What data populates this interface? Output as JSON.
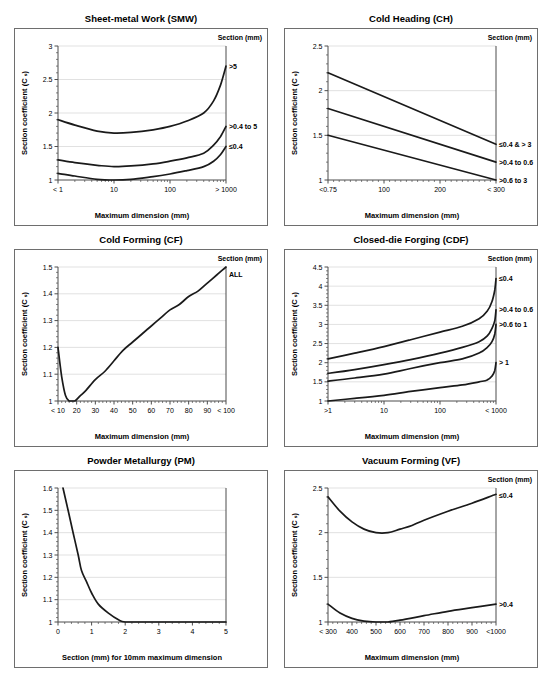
{
  "styles": {
    "curve_color": "#1a1a1a",
    "axis_color": "#4d4d4d",
    "grid_color": "#d9d9d9",
    "panel_border_color": "#6e6e6e",
    "text_color": "#000000"
  },
  "chart_data": [
    {
      "key": "smw",
      "type": "line",
      "title": "Sheet-metal Work (SMW)",
      "legend_title": "Section (mm)",
      "xlabel": "Maximum dimension (mm)",
      "ylabel": "Section coefficient (C ₛ)",
      "x_scale": "log",
      "x_min": 1,
      "x_max": 1000,
      "x_ticks": [
        {
          "value": 1,
          "label": "< 1"
        },
        {
          "value": 10,
          "label": "10"
        },
        {
          "value": 100,
          "label": "100"
        },
        {
          "value": 1000,
          "label": "> 1000"
        }
      ],
      "y_min": 1,
      "y_max": 3,
      "y_ticks": [
        1,
        1.5,
        2,
        2.5,
        3
      ],
      "y_minor_step": 0.1,
      "grid": true,
      "legend_position": "curve-ends-right",
      "series": [
        {
          "name": ">5",
          "points": [
            [
              1,
              1.9
            ],
            [
              2,
              1.82
            ],
            [
              5,
              1.73
            ],
            [
              10,
              1.7
            ],
            [
              20,
              1.71
            ],
            [
              50,
              1.75
            ],
            [
              100,
              1.8
            ],
            [
              200,
              1.88
            ],
            [
              400,
              2.0
            ],
            [
              600,
              2.18
            ],
            [
              800,
              2.42
            ],
            [
              1000,
              2.7
            ]
          ]
        },
        {
          "name": ">0.4 to 5",
          "points": [
            [
              1,
              1.3
            ],
            [
              2,
              1.26
            ],
            [
              5,
              1.22
            ],
            [
              10,
              1.2
            ],
            [
              20,
              1.21
            ],
            [
              50,
              1.24
            ],
            [
              100,
              1.28
            ],
            [
              200,
              1.33
            ],
            [
              400,
              1.4
            ],
            [
              600,
              1.52
            ],
            [
              800,
              1.65
            ],
            [
              1000,
              1.8
            ]
          ]
        },
        {
          "name": "≤0.4",
          "points": [
            [
              1,
              1.1
            ],
            [
              2,
              1.06
            ],
            [
              5,
              1.01
            ],
            [
              10,
              1.0
            ],
            [
              20,
              1.01
            ],
            [
              50,
              1.05
            ],
            [
              100,
              1.09
            ],
            [
              200,
              1.14
            ],
            [
              400,
              1.2
            ],
            [
              600,
              1.28
            ],
            [
              800,
              1.38
            ],
            [
              1000,
              1.5
            ]
          ]
        }
      ]
    },
    {
      "key": "ch",
      "type": "line",
      "title": "Cold Heading (CH)",
      "legend_title": "Section (mm)",
      "xlabel": "Maximum dimension (mm)",
      "ylabel": "Section coefficient (C ₛ)",
      "x_scale": "linear",
      "x_min": 0,
      "x_max": 300,
      "x_minor_step": 10,
      "x_ticks": [
        {
          "value": 0,
          "label": "<0.75"
        },
        {
          "value": 100,
          "label": "100"
        },
        {
          "value": 200,
          "label": "200"
        },
        {
          "value": 300,
          "label": "< 300"
        }
      ],
      "y_min": 1,
      "y_max": 2.5,
      "y_ticks": [
        1,
        1.5,
        2,
        2.5
      ],
      "y_minor_step": 0.1,
      "grid": true,
      "legend_position": "curve-ends-right",
      "series": [
        {
          "name": "≤0.4 & > 3",
          "points": [
            [
              0,
              2.2
            ],
            [
              300,
              1.4
            ]
          ]
        },
        {
          "name": ">0.4 to 0.6",
          "points": [
            [
              0,
              1.8
            ],
            [
              300,
              1.2
            ]
          ]
        },
        {
          "name": ">0.6 to 3",
          "points": [
            [
              0,
              1.5
            ],
            [
              300,
              1.0
            ]
          ]
        }
      ]
    },
    {
      "key": "cf",
      "type": "line",
      "title": "Cold Forming (CF)",
      "legend_title": "Section (mm)",
      "xlabel": "Maximum dimension (mm)",
      "ylabel": "Section coefficient (C ₛ)",
      "x_scale": "linear",
      "x_min": 10,
      "x_max": 100,
      "x_minor_step": 2,
      "x_ticks": [
        {
          "value": 10,
          "label": "< 10"
        },
        {
          "value": 20,
          "label": "20"
        },
        {
          "value": 30,
          "label": "30"
        },
        {
          "value": 40,
          "label": "40"
        },
        {
          "value": 50,
          "label": "50"
        },
        {
          "value": 60,
          "label": "60"
        },
        {
          "value": 70,
          "label": "70"
        },
        {
          "value": 80,
          "label": "80"
        },
        {
          "value": 90,
          "label": "90"
        },
        {
          "value": 100,
          "label": "< 100"
        }
      ],
      "y_min": 1,
      "y_max": 1.5,
      "y_ticks": [
        1,
        1.1,
        1.2,
        1.3,
        1.4,
        1.5
      ],
      "y_minor_step": 0.02,
      "grid": true,
      "legend_position": "curve-ends-right",
      "series": [
        {
          "name": "ALL",
          "points": [
            [
              10,
              1.2
            ],
            [
              12,
              1.09
            ],
            [
              14,
              1.02
            ],
            [
              16,
              1.0
            ],
            [
              19,
              1.0
            ],
            [
              22,
              1.02
            ],
            [
              25,
              1.04
            ],
            [
              30,
              1.08
            ],
            [
              35,
              1.11
            ],
            [
              40,
              1.15
            ],
            [
              45,
              1.19
            ],
            [
              50,
              1.22
            ],
            [
              55,
              1.25
            ],
            [
              60,
              1.28
            ],
            [
              65,
              1.31
            ],
            [
              70,
              1.34
            ],
            [
              75,
              1.36
            ],
            [
              80,
              1.39
            ],
            [
              85,
              1.41
            ],
            [
              90,
              1.44
            ],
            [
              95,
              1.47
            ],
            [
              100,
              1.5
            ]
          ]
        }
      ]
    },
    {
      "key": "cdf",
      "type": "line",
      "title": "Closed-die Forging (CDF)",
      "legend_title": "Section (mm)",
      "xlabel": "Maximum dimension (mm)",
      "ylabel": "Section coefficient (C ₛ)",
      "x_scale": "log",
      "x_min": 1,
      "x_max": 1000,
      "x_ticks": [
        {
          "value": 1,
          "label": ">1"
        },
        {
          "value": 10,
          "label": "10"
        },
        {
          "value": 100,
          "label": "100"
        },
        {
          "value": 1000,
          "label": "< 1000"
        }
      ],
      "y_min": 1,
      "y_max": 4.5,
      "y_ticks": [
        1,
        1.5,
        2,
        2.5,
        3,
        3.5,
        4,
        4.5
      ],
      "y_minor_step": 0.1,
      "grid": true,
      "legend_position": "curve-ends-right",
      "series": [
        {
          "name": "≤0.4",
          "points": [
            [
              1,
              2.1
            ],
            [
              3,
              2.25
            ],
            [
              10,
              2.42
            ],
            [
              30,
              2.6
            ],
            [
              100,
              2.8
            ],
            [
              250,
              2.95
            ],
            [
              500,
              3.15
            ],
            [
              700,
              3.35
            ],
            [
              850,
              3.6
            ],
            [
              950,
              3.9
            ],
            [
              1000,
              4.2
            ]
          ]
        },
        {
          "name": ">0.4 to 0.6",
          "points": [
            [
              1,
              1.72
            ],
            [
              3,
              1.82
            ],
            [
              10,
              1.95
            ],
            [
              30,
              2.08
            ],
            [
              100,
              2.25
            ],
            [
              250,
              2.4
            ],
            [
              500,
              2.55
            ],
            [
              700,
              2.7
            ],
            [
              850,
              2.9
            ],
            [
              950,
              3.1
            ],
            [
              1000,
              3.38
            ]
          ]
        },
        {
          "name": ">0.6 to 1",
          "points": [
            [
              1,
              1.52
            ],
            [
              3,
              1.6
            ],
            [
              10,
              1.7
            ],
            [
              30,
              1.85
            ],
            [
              100,
              2.0
            ],
            [
              250,
              2.1
            ],
            [
              500,
              2.25
            ],
            [
              700,
              2.4
            ],
            [
              850,
              2.55
            ],
            [
              950,
              2.75
            ],
            [
              1000,
              3.0
            ]
          ]
        },
        {
          "name": "> 1",
          "points": [
            [
              1,
              1.0
            ],
            [
              3,
              1.07
            ],
            [
              10,
              1.15
            ],
            [
              30,
              1.25
            ],
            [
              100,
              1.35
            ],
            [
              250,
              1.42
            ],
            [
              500,
              1.5
            ],
            [
              700,
              1.55
            ],
            [
              850,
              1.65
            ],
            [
              950,
              1.8
            ],
            [
              1000,
              2.0
            ]
          ]
        }
      ]
    },
    {
      "key": "pm",
      "type": "line",
      "title": "Powder Metallurgy (PM)",
      "legend_title": null,
      "xlabel": "Section (mm) for 10mm maximum dimension",
      "ylabel": "Section coefficient (C ₛ)",
      "x_scale": "linear",
      "x_min": 0,
      "x_max": 5,
      "x_minor_step": 0.2,
      "x_ticks": [
        {
          "value": 0,
          "label": "0"
        },
        {
          "value": 1,
          "label": "1"
        },
        {
          "value": 2,
          "label": "2"
        },
        {
          "value": 3,
          "label": "3"
        },
        {
          "value": 4,
          "label": "4"
        },
        {
          "value": 5,
          "label": "5"
        }
      ],
      "y_min": 1,
      "y_max": 1.6,
      "y_ticks": [
        1,
        1.1,
        1.2,
        1.3,
        1.4,
        1.5,
        1.6
      ],
      "y_minor_step": 0.02,
      "grid": true,
      "legend_position": "none",
      "series": [
        {
          "name": null,
          "points": [
            [
              0.15,
              1.6
            ],
            [
              0.3,
              1.5
            ],
            [
              0.45,
              1.4
            ],
            [
              0.6,
              1.3
            ],
            [
              0.7,
              1.23
            ],
            [
              0.85,
              1.18
            ],
            [
              1.0,
              1.13
            ],
            [
              1.2,
              1.08
            ],
            [
              1.5,
              1.04
            ],
            [
              1.8,
              1.01
            ],
            [
              2.0,
              1.0
            ],
            [
              2.5,
              1.0
            ],
            [
              3,
              1.0
            ],
            [
              4,
              1.0
            ],
            [
              5,
              1.0
            ]
          ]
        }
      ]
    },
    {
      "key": "vf",
      "type": "line",
      "title": "Vacuum Forming (VF)",
      "legend_title": "Section (mm)",
      "xlabel": "Maximum dimension (mm)",
      "ylabel": "Section coefficient (C ₛ)",
      "x_scale": "linear",
      "x_min": 300,
      "x_max": 1000,
      "x_minor_step": 20,
      "x_ticks": [
        {
          "value": 300,
          "label": "< 300"
        },
        {
          "value": 400,
          "label": "400"
        },
        {
          "value": 500,
          "label": "500"
        },
        {
          "value": 600,
          "label": "600"
        },
        {
          "value": 700,
          "label": "700"
        },
        {
          "value": 800,
          "label": "800"
        },
        {
          "value": 900,
          "label": "900"
        },
        {
          "value": 1000,
          "label": "<1000"
        }
      ],
      "y_min": 1,
      "y_max": 2.5,
      "y_ticks": [
        1,
        1.5,
        2,
        2.5
      ],
      "y_minor_step": 0.1,
      "grid": true,
      "legend_position": "curve-ends-right",
      "series": [
        {
          "name": "≤0.4",
          "points": [
            [
              300,
              2.4
            ],
            [
              350,
              2.24
            ],
            [
              400,
              2.12
            ],
            [
              450,
              2.04
            ],
            [
              500,
              2.0
            ],
            [
              550,
              2.0
            ],
            [
              600,
              2.04
            ],
            [
              650,
              2.08
            ],
            [
              700,
              2.14
            ],
            [
              800,
              2.24
            ],
            [
              900,
              2.33
            ],
            [
              1000,
              2.43
            ]
          ]
        },
        {
          "name": ">0.4",
          "points": [
            [
              300,
              1.2
            ],
            [
              350,
              1.1
            ],
            [
              400,
              1.04
            ],
            [
              450,
              1.01
            ],
            [
              500,
              1.0
            ],
            [
              550,
              1.0
            ],
            [
              600,
              1.02
            ],
            [
              700,
              1.07
            ],
            [
              800,
              1.12
            ],
            [
              900,
              1.16
            ],
            [
              1000,
              1.2
            ]
          ]
        }
      ]
    }
  ]
}
